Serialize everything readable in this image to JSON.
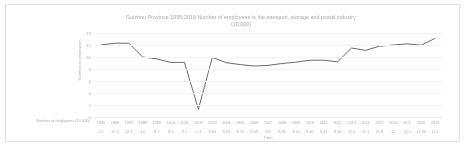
{
  "chart_data": {
    "type": "line",
    "title": "Guizhou Province 1995-2019 Number of employees in the transport, storage and postal industry",
    "subtitle": "(10,000)",
    "xlabel": "Time",
    "ylabel": "Number of employees",
    "series_label": "Number of employees (10,000)",
    "grid": true,
    "legend": "none",
    "line_color": "#595959",
    "ylim": [
      0,
      14
    ],
    "yticks": [
      "14",
      "12",
      "10",
      "8",
      "6",
      "4",
      "2",
      "0"
    ],
    "ytick_values": [
      14,
      12,
      10,
      8,
      6,
      4,
      2,
      0
    ],
    "categories": [
      "1995",
      "1996",
      "1997",
      "1998",
      "1999",
      "2000",
      "2001",
      "2002",
      "2003",
      "2004",
      "2005",
      "2006",
      "2007",
      "2008",
      "2009",
      "2010",
      "2011",
      "2012",
      "2013",
      "2014",
      "2015",
      "2016",
      "2017",
      "2018",
      "2019"
    ],
    "values": [
      12,
      12.3,
      12.3,
      10,
      9.7,
      9.1,
      9.1,
      1.3,
      9.94,
      9.05,
      8.74,
      8.49,
      8.6,
      8.91,
      9.14,
      9.46,
      9.47,
      9.19,
      11.5,
      11.1,
      11.8,
      12,
      12.2,
      11.96,
      13.1
    ],
    "value_labels": [
      "12",
      "12.3",
      "12.3",
      "10",
      "9.7",
      "9.1",
      "9.1",
      "1.3",
      "9.94",
      "9.05",
      "8.74",
      "8.49",
      "8.6",
      "8.91",
      "9.14",
      "9.46",
      "9.47",
      "9.19",
      "11.5",
      "11.1",
      "11.8",
      "12",
      "12.2",
      "11.96",
      "13.1"
    ]
  }
}
